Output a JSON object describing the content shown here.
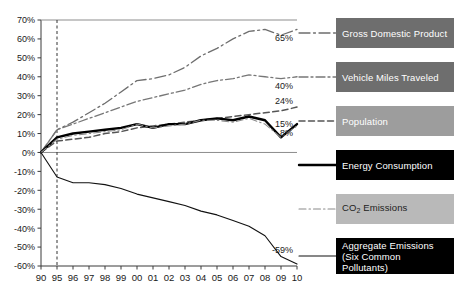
{
  "chart_data": {
    "type": "line",
    "title": "",
    "xlabel": "",
    "ylabel": "",
    "x": [
      "90",
      "95",
      "96",
      "97",
      "98",
      "99",
      "00",
      "01",
      "02",
      "03",
      "04",
      "05",
      "06",
      "07",
      "08",
      "09",
      "10"
    ],
    "xtick_labels": [
      "90",
      "95",
      "96",
      "97",
      "98",
      "99",
      "00",
      "01",
      "02",
      "03",
      "04",
      "05",
      "06",
      "07",
      "08",
      "09",
      "10"
    ],
    "ytick_labels": [
      "70%",
      "60%",
      "50%",
      "40%",
      "30%",
      "20%",
      "10%",
      "0%",
      "-10%",
      "-20%",
      "-30%",
      "-40%",
      "-50%",
      "-60%"
    ],
    "ytick_values": [
      70,
      60,
      50,
      40,
      30,
      20,
      10,
      0,
      -10,
      -20,
      -30,
      -40,
      -50,
      -60
    ],
    "ylim": [
      -60,
      70
    ],
    "grid": false,
    "legend_position": "right",
    "reference_line_x": "95",
    "zero_line": 0,
    "series": [
      {
        "name": "Gross Domestic Product",
        "key": "gdp",
        "style": "dash-dot-long",
        "color": "#6e6e6e",
        "end_label": "65%",
        "values": [
          0,
          12,
          16,
          21,
          26,
          32,
          38,
          39,
          41,
          45,
          51,
          55,
          60,
          64,
          65,
          62,
          65
        ]
      },
      {
        "name": "Vehicle Miles Traveled",
        "key": "vmt",
        "style": "dash-dot",
        "color": "#777777",
        "end_label": "40%",
        "values": [
          0,
          12,
          15,
          18,
          21,
          24,
          27,
          29,
          31,
          33,
          36,
          38,
          39,
          41,
          40,
          39,
          40
        ]
      },
      {
        "name": "Population",
        "key": "population",
        "style": "dashed",
        "color": "#555555",
        "end_label": "24%",
        "values": [
          0,
          6,
          7,
          8,
          10,
          11,
          13,
          14,
          15,
          16,
          17,
          18,
          19,
          20,
          21,
          22,
          24
        ]
      },
      {
        "name": "Energy Consumption",
        "key": "energy",
        "style": "solid-thick",
        "color": "#000000",
        "end_label": "15%",
        "low_label": "8%",
        "values": [
          0,
          8,
          10,
          11,
          12,
          13,
          15,
          13,
          15,
          15,
          17,
          18,
          17,
          19,
          17,
          8,
          15
        ]
      },
      {
        "name": "CO2 Emissions",
        "key": "co2",
        "style": "dash-dot-fine",
        "color": "#8a8a8a",
        "values": [
          0,
          7,
          9,
          10,
          11,
          12,
          15,
          13,
          14,
          15,
          17,
          17,
          16,
          18,
          15,
          8,
          14
        ]
      },
      {
        "name": "Aggregate Emissions (Six Common Pollutants)",
        "key": "aggregate",
        "style": "solid-thin",
        "color": "#111111",
        "end_label": "-59%",
        "values": [
          0,
          -13,
          -16,
          -16,
          -17,
          -19,
          -22,
          -24,
          -26,
          -28,
          -31,
          -33,
          -36,
          -39,
          -44,
          -55,
          -59
        ]
      }
    ],
    "annotations": [
      {
        "label": "65%",
        "series": "gdp"
      },
      {
        "label": "40%",
        "series": "vmt"
      },
      {
        "label": "24%",
        "series": "population"
      },
      {
        "label": "15%",
        "series": "energy"
      },
      {
        "label": "8%",
        "series": "energy"
      },
      {
        "label": "-59%",
        "series": "aggregate"
      }
    ]
  },
  "legend": {
    "items": [
      {
        "label": "Gross Domestic Product",
        "style": "dark"
      },
      {
        "label": "Vehicle Miles Traveled",
        "style": "dark"
      },
      {
        "label": "Population",
        "style": "mid"
      },
      {
        "label": "Energy Consumption",
        "style": "black"
      },
      {
        "label": "CO2 Emissions",
        "style": "light",
        "label_html": "CO<sub>2</sub> Emissions"
      },
      {
        "label": "Aggregate Emissions (Six Common Pollutants)",
        "style": "black",
        "line1": "Aggregate Emissions",
        "line2": "(Six Common Pollutants)"
      }
    ]
  }
}
